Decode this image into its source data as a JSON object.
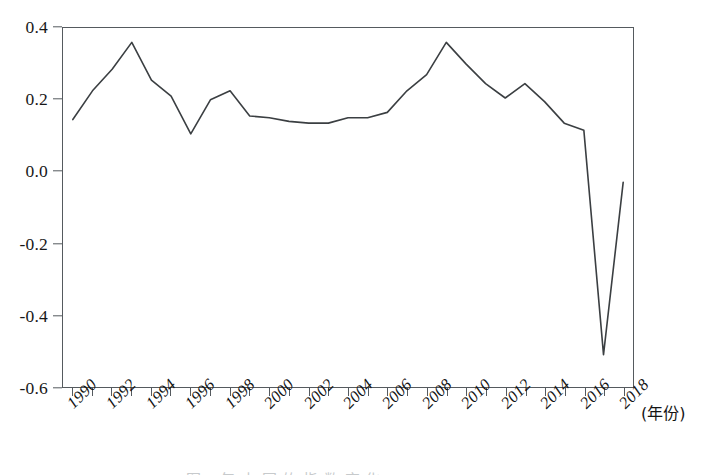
{
  "chart_data": {
    "type": "line",
    "title": "",
    "xlabel": "(年份)",
    "ylabel": "",
    "xlim": [
      1989.5,
      2018.5
    ],
    "ylim": [
      -0.6,
      0.4
    ],
    "grid": false,
    "legend": null,
    "x_tick_labels": [
      "1990",
      "1992",
      "1994",
      "1996",
      "1998",
      "2000",
      "2002",
      "2004",
      "2006",
      "2008",
      "2010",
      "2012",
      "2014",
      "2016",
      "2018"
    ],
    "y_tick_labels": [
      "0.4",
      "0.2",
      "0.0",
      "-0.2",
      "-0.4",
      "-0.6"
    ],
    "y_tick_values": [
      0.4,
      0.2,
      0.0,
      -0.2,
      -0.4,
      -0.6
    ],
    "x": [
      1990,
      1991,
      1992,
      1993,
      1994,
      1995,
      1996,
      1997,
      1998,
      1999,
      2000,
      2001,
      2002,
      2003,
      2004,
      2005,
      2006,
      2007,
      2008,
      2009,
      2010,
      2011,
      2012,
      2013,
      2014,
      2015,
      2016,
      2017,
      2018
    ],
    "values": [
      0.145,
      0.225,
      0.285,
      0.36,
      0.255,
      0.21,
      0.105,
      0.2,
      0.225,
      0.155,
      0.15,
      0.14,
      0.135,
      0.135,
      0.15,
      0.15,
      0.165,
      0.225,
      0.27,
      0.36,
      0.3,
      0.245,
      0.205,
      0.245,
      0.195,
      0.135,
      0.115,
      -0.51,
      -0.03
    ],
    "line_color": "#3b3f42",
    "line_width": 1.6,
    "markers": false,
    "series_name": ""
  },
  "axis": {
    "x_title": "(年份)",
    "frame_color": "#555a5e"
  },
  "caption": {
    "sliver_text": "图 1 年 中 国 的 指 数 变 化"
  }
}
